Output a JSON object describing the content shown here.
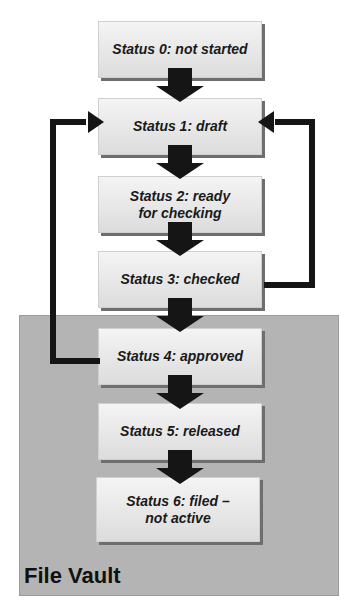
{
  "diagram": {
    "statuses": [
      {
        "id": 0,
        "label": "Status 0: not started"
      },
      {
        "id": 1,
        "label": "Status 1: draft"
      },
      {
        "id": 2,
        "label": "Status 2: ready\nfor checking"
      },
      {
        "id": 3,
        "label": "Status 3: checked"
      },
      {
        "id": 4,
        "label": "Status 4: approved"
      },
      {
        "id": 5,
        "label": "Status 5: released"
      },
      {
        "id": 6,
        "label": "Status 6: filed –\nnot active"
      }
    ],
    "region": {
      "label": "File Vault",
      "color": "#b4b4b4"
    },
    "feedback_arrows": [
      {
        "from": "Status 3: checked",
        "to": "Status 1: draft",
        "side": "right"
      },
      {
        "from": "Status 4: approved",
        "to": "Status 1: draft",
        "side": "left"
      }
    ]
  }
}
